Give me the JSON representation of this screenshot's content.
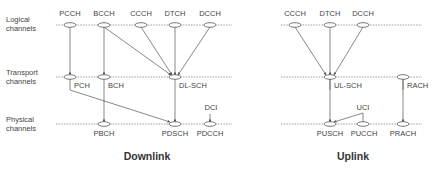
{
  "layers": {
    "logical": [
      "Logical",
      "channels"
    ],
    "transport": [
      "Transport",
      "channels"
    ],
    "physical": [
      "Physical",
      "channels"
    ]
  },
  "downlink": {
    "title": "Downlink",
    "logical": [
      "PCCH",
      "BCCH",
      "CCCH",
      "DTCH",
      "DCCH"
    ],
    "transport": [
      "PCH",
      "BCH",
      "DL-SCH"
    ],
    "physical": [
      "PBCH",
      "PDSCH",
      "PDCCH"
    ],
    "control": "DCI",
    "mappings": [
      [
        "PCCH",
        "PCH"
      ],
      [
        "BCCH",
        "BCH"
      ],
      [
        "BCCH",
        "DL-SCH"
      ],
      [
        "CCCH",
        "DL-SCH"
      ],
      [
        "DTCH",
        "DL-SCH"
      ],
      [
        "DCCH",
        "DL-SCH"
      ],
      [
        "PCH",
        "PDSCH"
      ],
      [
        "BCH",
        "PBCH"
      ],
      [
        "DL-SCH",
        "PDSCH"
      ],
      [
        "DCI",
        "PDCCH"
      ]
    ]
  },
  "uplink": {
    "title": "Uplink",
    "logical": [
      "CCCH",
      "DTCH",
      "DCCH"
    ],
    "transport": [
      "UL-SCH",
      "RACH"
    ],
    "physical": [
      "PUSCH",
      "PUCCH",
      "PRACH"
    ],
    "control": "UCI",
    "mappings": [
      [
        "CCCH",
        "UL-SCH"
      ],
      [
        "DTCH",
        "UL-SCH"
      ],
      [
        "DCCH",
        "UL-SCH"
      ],
      [
        "UL-SCH",
        "PUSCH"
      ],
      [
        "RACH",
        "PRACH"
      ],
      [
        "UCI",
        "PUSCH"
      ],
      [
        "UCI",
        "PUCCH"
      ]
    ]
  }
}
